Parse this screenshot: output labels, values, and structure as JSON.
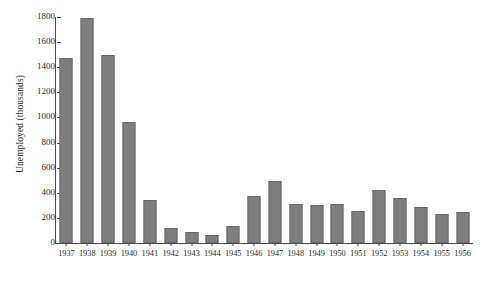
{
  "chart_data": {
    "type": "bar",
    "title": "",
    "xlabel": "",
    "ylabel": "Unemployed (thousands)",
    "ylim": [
      0,
      1800
    ],
    "yticks": [
      0,
      200,
      400,
      600,
      800,
      1000,
      1200,
      1400,
      1600,
      1800
    ],
    "ytick_labels": [
      "0",
      "200",
      "400",
      "600",
      "800",
      "1000",
      "1200",
      "1400",
      "1600",
      "1800"
    ],
    "grid": false,
    "legend": null,
    "bar_color": "#7e7e7e",
    "bar_edge_color": "#6a6a6a",
    "axis_color": "#4d4d4d",
    "categories": [
      "1937",
      "1938",
      "1939",
      "1940",
      "1941",
      "1942",
      "1943",
      "1944",
      "1945",
      "1946",
      "1947",
      "1948",
      "1949",
      "1950",
      "1951",
      "1952",
      "1953",
      "1954",
      "1955",
      "1956"
    ],
    "values": [
      1470,
      1790,
      1500,
      960,
      345,
      120,
      85,
      65,
      135,
      375,
      490,
      310,
      305,
      310,
      255,
      420,
      360,
      285,
      235,
      250
    ]
  }
}
